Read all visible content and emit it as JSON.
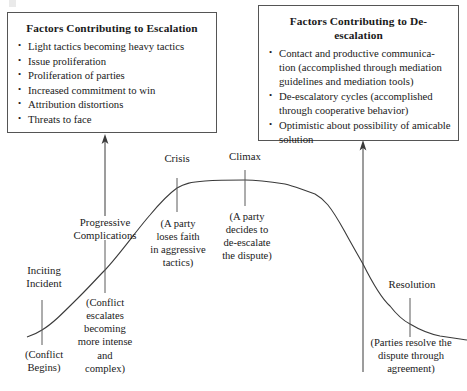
{
  "diagram": {
    "title_escalation_box": "Factors Contributing to Escalation",
    "title_deescalation_box": "Factors Contributing to De-escalation",
    "bullet_glyph": "•",
    "escalation_factors": [
      "Light tactics becoming heavy tactics",
      "Issue proliferation",
      "Proliferation of parties",
      "Increased commitment to win",
      "Attribution distortions",
      "Threats to face"
    ],
    "deescalation_factors": [
      "Contact and productive communica-tion (accomplished through mediation guidelines and mediation tools)",
      "De-escalatory cycles (accomplished through cooperative behavior)",
      "Optimistic about possibility of amicable solution"
    ],
    "stages": [
      {
        "id": "inciting-incident",
        "label": "Inciting\nIncident",
        "description": "(Conflict\nBegins)",
        "tick_x": 42,
        "tick_y_top": 300,
        "tick_y_bottom": 345
      },
      {
        "id": "progressive-complications",
        "label": "Progressive\nComplications",
        "description": "(Conflict\nescalates\nbecoming\nmore intense\nand\ncomplex)",
        "tick_x": 105,
        "tick_y_top": 240,
        "tick_y_bottom": 293
      },
      {
        "id": "crisis",
        "label": "Crisis",
        "description": "(A party\nloses faith\nin aggressive\ntactics)",
        "tick_x": 177,
        "tick_y_top": 178,
        "tick_y_bottom": 212
      },
      {
        "id": "climax",
        "label": "Climax",
        "description": "(A party\ndecides to\nde-escalate\nthe dispute)",
        "tick_x": 245,
        "tick_y_top": 170,
        "tick_y_bottom": 206
      },
      {
        "id": "resolution",
        "label": "Resolution",
        "description": "(Parties resolve the\ndispute through\nagreement)",
        "tick_x": 410,
        "tick_y_top": 298,
        "tick_y_bottom": 337
      }
    ],
    "colors": {
      "line": "#3a3a3a",
      "box_border": "#555555",
      "text": "#1a1a1a",
      "background": "#ffffff"
    }
  },
  "chart_data": {
    "type": "line",
    "xlabel": "",
    "ylabel": "",
    "grid": false,
    "legend": "none",
    "x": [
      27,
      42,
      60,
      80,
      105,
      128,
      150,
      165,
      177,
      190,
      205,
      225,
      245,
      265,
      285,
      300,
      315,
      330,
      345,
      355,
      363,
      375,
      390,
      402,
      410,
      425,
      440,
      455,
      467
    ],
    "y": [
      337,
      330,
      316,
      296,
      270,
      241,
      215,
      199,
      188,
      183,
      181,
      180,
      180,
      181,
      184,
      188,
      194,
      209,
      232,
      250,
      264,
      288,
      306,
      318,
      324,
      331,
      335,
      338,
      340
    ],
    "annotations": [
      {
        "text": "Inciting Incident",
        "x": 42,
        "y": 330
      },
      {
        "text": "Progressive Complications",
        "x": 105,
        "y": 270
      },
      {
        "text": "Crisis",
        "x": 177,
        "y": 188
      },
      {
        "text": "Climax",
        "x": 245,
        "y": 180
      },
      {
        "text": "Resolution",
        "x": 410,
        "y": 324
      }
    ],
    "arrows": [
      {
        "name": "escalation-arrow",
        "x": 105,
        "y_from": 216,
        "y_to": 137
      },
      {
        "name": "deescalation-arrow",
        "x": 363,
        "y_from": 372,
        "y_to": 144
      }
    ]
  }
}
